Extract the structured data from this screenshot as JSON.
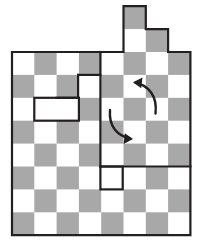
{
  "figure": {
    "type": "grid-diagram"
  },
  "colors": {
    "shaded_cell": "#a8a8a8",
    "light_cell": "#ffffff",
    "outline": "#231f20",
    "background": "#ffffff",
    "arrow": "#231f20"
  },
  "grid": {
    "origin_x": 12,
    "origin_y": 52,
    "cell_w": 22.3,
    "cell_h": 22.9,
    "cols": 8,
    "rows": 8,
    "parity_offset": 0,
    "stroke_width": 2.2
  },
  "top_protrusion": {
    "cells": [
      {
        "col": 5,
        "row": -2,
        "shaded": true
      },
      {
        "col": 5,
        "row": -1,
        "shaded": false
      },
      {
        "col": 6,
        "row": -1,
        "shaded": true
      }
    ]
  },
  "board_outline_points": "12,52 123.5,52 123.5,6.2 145.8,6.2 145.8,29.1 168.1,29.1 168.1,52 190.4,52 190.4,235.2 12,235.2",
  "internal_lines": [
    {
      "name": "notch-step-vertical",
      "x1": 78.1,
      "y1": 74.9,
      "x2": 78.1,
      "y2": 97.8
    },
    {
      "name": "notch-step-horizontal",
      "x1": 78.1,
      "y1": 74.9,
      "x2": 100.4,
      "y2": 74.9
    },
    {
      "name": "notch-left-horizontal",
      "x1": 56.6,
      "y1": 97.8,
      "x2": 78.1,
      "y2": 97.8
    },
    {
      "name": "column-divider",
      "x1": 100.4,
      "y1": 52.0,
      "x2": 100.4,
      "y2": 166.5
    },
    {
      "name": "mid-horizontal-right",
      "x1": 100.4,
      "y1": 166.5,
      "x2": 190.4,
      "y2": 166.5
    }
  ],
  "internal_rects": [
    {
      "name": "white-domino",
      "x": 34.3,
      "y": 97.8,
      "w": 44.6,
      "h": 22.9,
      "fill": "#ffffff"
    },
    {
      "name": "white-unit-square",
      "x": 100.4,
      "y": 166.5,
      "w": 22.3,
      "h": 22.9,
      "fill": "#ffffff"
    }
  ],
  "arrows": [
    {
      "name": "arrow-up-left",
      "direction": "counterclockwise",
      "path": "M 155.5 113.5 C 157.5 96.5 149 85.5 135.5 82.8",
      "head": "133.0,82.3 142.5,77.6 141.2,88.2"
    },
    {
      "name": "arrow-down-right",
      "direction": "clockwise",
      "path": "M 110.0 110.0 C 108.5 126.5 117.5 136.0 130.5 138.6",
      "head": "133.0,139.0 123.6,143.9 124.8,133.2"
    }
  ],
  "shaded_cells": [
    [
      0,
      1
    ],
    [
      0,
      3
    ],
    [
      0,
      5
    ],
    [
      0,
      7
    ],
    [
      1,
      0
    ],
    [
      1,
      2
    ],
    [
      1,
      4
    ],
    [
      1,
      6
    ],
    [
      2,
      1
    ],
    [
      2,
      3
    ],
    [
      2,
      5
    ],
    [
      2,
      7
    ],
    [
      3,
      0
    ],
    [
      3,
      2
    ],
    [
      3,
      4
    ],
    [
      3,
      6
    ],
    [
      4,
      1
    ],
    [
      4,
      3
    ],
    [
      4,
      5
    ],
    [
      4,
      7
    ],
    [
      5,
      0
    ],
    [
      5,
      2
    ],
    [
      5,
      4
    ],
    [
      5,
      6
    ],
    [
      6,
      1
    ],
    [
      6,
      3
    ],
    [
      6,
      5
    ],
    [
      6,
      7
    ],
    [
      7,
      0
    ],
    [
      7,
      2
    ],
    [
      7,
      4
    ],
    [
      7,
      6
    ]
  ]
}
